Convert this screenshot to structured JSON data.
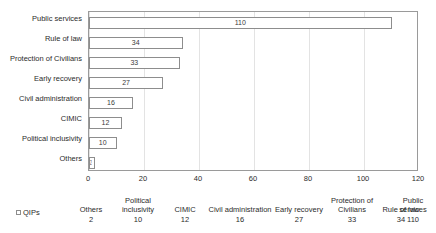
{
  "chart_data": {
    "type": "bar",
    "orientation": "horizontal",
    "title": "",
    "xlabel": "",
    "ylabel": "",
    "categories": [
      "Public services",
      "Rule of law",
      "Protection of Civilians",
      "Early recovery",
      "Civil administration",
      "CIMIC",
      "Political inclusivity",
      "Others"
    ],
    "values": [
      110,
      34,
      33,
      27,
      16,
      12,
      10,
      2
    ],
    "series": [
      {
        "name": "QIPs",
        "values": [
          110,
          34,
          33,
          27,
          16,
          12,
          10,
          2
        ]
      }
    ],
    "xlim": [
      0,
      120
    ],
    "xticks": [
      0,
      20,
      40,
      60,
      80,
      100,
      120
    ],
    "xtick_labels": [
      "0",
      "20",
      "40",
      "60",
      "80",
      "100",
      "120"
    ],
    "grid": true,
    "grid_axis": "x",
    "legend": [
      "QIPs"
    ],
    "legend_position": "bottom-left",
    "data_labels": [
      "110",
      "34",
      "33",
      "27",
      "16",
      "12",
      "10",
      "2"
    ],
    "bar_fill_color": "#ffffff",
    "bar_border_color": "#8d8d8d",
    "grid_color": "#e3e3e3",
    "axis_color": "#9a9a9a",
    "text_color": "#2b2b2b"
  },
  "data_table": {
    "legend_label": "QIPs",
    "columns": [
      "Others",
      "Political inclusivity",
      "CIMIC",
      "Civil administration",
      "Early recovery",
      "Protection of Civilians",
      "Rule of law",
      "Public services"
    ],
    "row_values": [
      "2",
      "10",
      "12",
      "16",
      "27",
      "33",
      "34",
      "110"
    ]
  }
}
